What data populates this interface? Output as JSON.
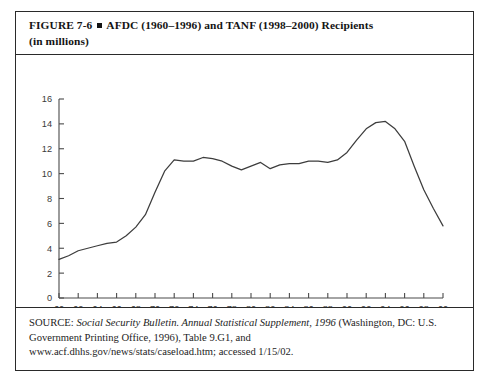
{
  "figure": {
    "number": "FIGURE  7-6",
    "bullet": "square-marker",
    "title_line1": "AFDC (1960–1996) and TANF (1998–2000) Recipients",
    "title_line2": "(in millions)"
  },
  "source": {
    "label": "SOURCE:",
    "italic_part": "Social Security Bulletin. Annual Statistical Supplement, 1996",
    "rest_line1": "(Washington, DC: U.S.",
    "line2": "Government Printing Office, 1996), Table 9.G1, and",
    "line3": "www.acf.dhhs.gov/news/stats/caseload.htm; accessed 1/15/02."
  },
  "chart_data": {
    "type": "line",
    "title": "AFDC (1960–1996) and TANF (1998–2000) Recipients (in millions)",
    "xlabel": "",
    "ylabel": "",
    "grid": false,
    "legend": "none",
    "xlim": [
      1960,
      2000
    ],
    "ylim": [
      0,
      16
    ],
    "ytick_values": [
      0,
      2,
      4,
      6,
      8,
      10,
      12,
      14,
      16
    ],
    "ytick_labels": [
      "0",
      "2",
      "4",
      "6",
      "8",
      "10",
      "12",
      "14",
      "16"
    ],
    "xtick_values": [
      1960,
      1962,
      1964,
      1966,
      1968,
      1970,
      1972,
      1974,
      1976,
      1978,
      1980,
      1982,
      1984,
      1986,
      1988,
      1990,
      1992,
      1994,
      1996,
      1998,
      2000
    ],
    "xtick_labels": [
      "60",
      "62",
      "64",
      "66",
      "68",
      "70",
      "72",
      "74",
      "76",
      "78",
      "80",
      "82",
      "84",
      "86",
      "88",
      "90",
      "92",
      "94",
      "96",
      "98",
      "00"
    ],
    "series": [
      {
        "name": "AFDC / TANF recipients",
        "x": [
          1960,
          1961,
          1962,
          1963,
          1964,
          1965,
          1966,
          1967,
          1968,
          1969,
          1970,
          1971,
          1972,
          1973,
          1974,
          1975,
          1976,
          1977,
          1978,
          1979,
          1980,
          1981,
          1982,
          1983,
          1984,
          1985,
          1986,
          1987,
          1988,
          1989,
          1990,
          1991,
          1992,
          1993,
          1994,
          1995,
          1996,
          1997,
          1998,
          1999,
          2000
        ],
        "values": [
          3.1,
          3.4,
          3.8,
          4.0,
          4.2,
          4.4,
          4.5,
          5.0,
          5.7,
          6.7,
          8.5,
          10.2,
          11.1,
          11.0,
          11.0,
          11.3,
          11.2,
          11.0,
          10.6,
          10.3,
          10.6,
          10.9,
          10.4,
          10.7,
          10.8,
          10.8,
          11.0,
          11.0,
          10.9,
          11.1,
          11.7,
          12.7,
          13.6,
          14.1,
          14.2,
          13.6,
          12.6,
          10.6,
          8.7,
          7.2,
          5.8
        ]
      }
    ]
  }
}
